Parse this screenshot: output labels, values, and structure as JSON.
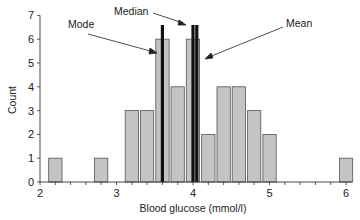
{
  "chart_data": {
    "type": "bar",
    "title": "",
    "xlabel": "Blood glucose (mmol/l)",
    "ylabel": "Count",
    "xlim": [
      2,
      6.1
    ],
    "ylim": [
      0,
      7
    ],
    "x_ticks": [
      2,
      3,
      4,
      5,
      6
    ],
    "y_ticks": [
      0,
      1,
      2,
      3,
      4,
      5,
      6,
      7
    ],
    "bin_width": 0.2,
    "grid": false,
    "bars": [
      {
        "x": 2.2,
        "count": 1
      },
      {
        "x": 2.8,
        "count": 1
      },
      {
        "x": 3.2,
        "count": 3
      },
      {
        "x": 3.4,
        "count": 3
      },
      {
        "x": 3.6,
        "count": 6
      },
      {
        "x": 3.8,
        "count": 4
      },
      {
        "x": 4.0,
        "count": 6
      },
      {
        "x": 4.2,
        "count": 2
      },
      {
        "x": 4.4,
        "count": 4
      },
      {
        "x": 4.6,
        "count": 4
      },
      {
        "x": 4.8,
        "count": 3
      },
      {
        "x": 5.0,
        "count": 2
      },
      {
        "x": 6.0,
        "count": 1
      }
    ],
    "reference_lines": [
      {
        "name": "Mode",
        "x": 3.6
      },
      {
        "name": "Median",
        "x": 4.0
      },
      {
        "name": "Mean",
        "x": 4.05
      }
    ],
    "annotations": [
      "Mode",
      "Median",
      "Mean"
    ],
    "colors": {
      "bar_fill": "#c4c4c4",
      "bar_stroke": "#555555",
      "ref_line": "#111111"
    }
  },
  "labels": {
    "ylabel": "Count",
    "xlabel": "Blood glucose (mmol/l)",
    "mode": "Mode",
    "median": "Median",
    "mean": "Mean",
    "xticks": [
      "2",
      "3",
      "4",
      "5",
      "6"
    ],
    "yticks": [
      "0",
      "1",
      "2",
      "3",
      "4",
      "5",
      "6",
      "7"
    ]
  }
}
